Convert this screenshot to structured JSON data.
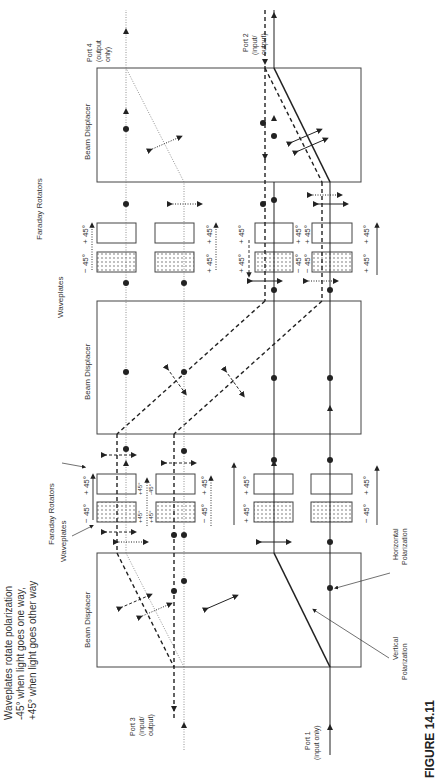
{
  "figure": {
    "caption": "FIGURE 14.11",
    "note_line1": "Waveplates rotate polarization",
    "note_line2": "-45° when light goes one way,",
    "note_line3": "+45° when light goes other way"
  },
  "components": {
    "beam_displacer_label": "Beam Displacer",
    "waveplates_label": "Waveplates",
    "faraday_label": "Faraday Rotators"
  },
  "ports": {
    "port1_line1": "Port 1",
    "port1_line2": "(input only)",
    "port2_line1": "Port 2",
    "port2_line2": "(input/",
    "port2_line3": "output)",
    "port3_line1": "Port 3",
    "port3_line2": "(input/",
    "port3_line3": "output)",
    "port4_line1": "Port 4",
    "port4_line2": "(output",
    "port4_line3": "only)"
  },
  "polarization": {
    "horizontal_line1": "Horizontal",
    "horizontal_line2": "Polarization",
    "vertical_line1": "Vertical",
    "vertical_line2": "Polarization"
  },
  "angles": {
    "plus45": "+ 45°",
    "minus45": "− 45°",
    "plus45_small": "+45°",
    "minus45_small": "-45°"
  }
}
